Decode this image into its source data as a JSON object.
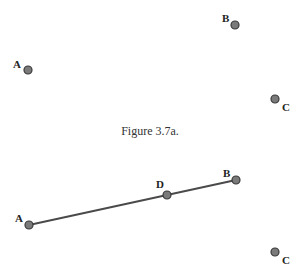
{
  "figure_a": {
    "caption": "Figure 3.7a.",
    "points": [
      {
        "name": "A",
        "x": 28,
        "y": 70,
        "label_x": 13,
        "label_y": 68
      },
      {
        "name": "B",
        "x": 235,
        "y": 25,
        "label_x": 222,
        "label_y": 22
      },
      {
        "name": "C",
        "x": 275,
        "y": 99,
        "label_x": 282,
        "label_y": 111
      }
    ]
  },
  "figure_b": {
    "segment": {
      "from": "A",
      "to": "B"
    },
    "points": [
      {
        "name": "A",
        "x": 29,
        "y": 225,
        "label_x": 15,
        "label_y": 222
      },
      {
        "name": "D",
        "x": 167,
        "y": 195,
        "label_x": 156,
        "label_y": 188
      },
      {
        "name": "B",
        "x": 236,
        "y": 180,
        "label_x": 223,
        "label_y": 177
      },
      {
        "name": "C",
        "x": 275,
        "y": 252,
        "label_x": 282,
        "label_y": 264
      }
    ]
  },
  "colors": {
    "point_fill": "#7a7a7a",
    "point_stroke": "#3a3a3a",
    "segment": "#4a4a4a",
    "label": "#222222"
  }
}
